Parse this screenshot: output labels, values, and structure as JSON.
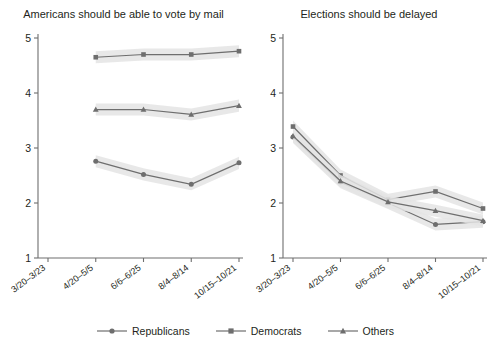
{
  "chart_data": [
    {
      "type": "line",
      "title": "Americans should be able to vote by mail",
      "xlabel": "",
      "ylabel": "",
      "ylim": [
        1,
        5
      ],
      "yticks": [
        1,
        2,
        3,
        4,
        5
      ],
      "grid": false,
      "legend_position": "bottom",
      "categories": [
        "3/20–3/23",
        "4/20–5/5",
        "6/6–6/25",
        "8/4–8/14",
        "10/15–10/21"
      ],
      "series": [
        {
          "name": "Republicans",
          "marker": "circle",
          "values": [
            null,
            2.76,
            2.52,
            2.34,
            2.73
          ]
        },
        {
          "name": "Democrats",
          "marker": "square",
          "values": [
            null,
            4.65,
            4.7,
            4.7,
            4.76
          ]
        },
        {
          "name": "Others",
          "marker": "triangle",
          "values": [
            null,
            3.7,
            3.7,
            3.61,
            3.77
          ]
        }
      ]
    },
    {
      "type": "line",
      "title": "Elections should be delayed",
      "xlabel": "",
      "ylabel": "",
      "ylim": [
        1,
        5
      ],
      "yticks": [
        1,
        2,
        3,
        4,
        5
      ],
      "grid": false,
      "legend_position": "bottom",
      "categories": [
        "3/20–3/23",
        "4/20–5/5",
        "6/6–6/25",
        "8/4–8/14",
        "10/15–10/21"
      ],
      "series": [
        {
          "name": "Republicans",
          "marker": "circle",
          "values": [
            3.2,
            2.38,
            2.0,
            1.61,
            1.66
          ]
        },
        {
          "name": "Democrats",
          "marker": "square",
          "values": [
            3.39,
            2.5,
            2.06,
            2.21,
            1.9
          ]
        },
        {
          "name": "Others",
          "marker": "triangle",
          "values": [
            3.22,
            2.4,
            2.02,
            1.86,
            1.68
          ]
        }
      ]
    }
  ],
  "legend": {
    "items": [
      {
        "label": "Republicans",
        "marker": "circle"
      },
      {
        "label": "Democrats",
        "marker": "square"
      },
      {
        "label": "Others",
        "marker": "triangle"
      }
    ]
  },
  "style": {
    "line_color": "#6e6e6e",
    "band_color": "#e4e4e4",
    "axis_color": "#6e6e6e",
    "text_color": "#231f20",
    "background": "#ffffff"
  }
}
